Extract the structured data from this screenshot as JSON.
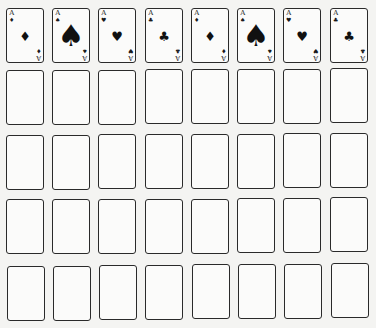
{
  "board": {
    "layout": {
      "columns": 8,
      "rows": 5,
      "origin_x": [
        6,
        52,
        98,
        145,
        191,
        237,
        283,
        330
      ],
      "origin_y": [
        8,
        70,
        134,
        198,
        263
      ]
    },
    "colors": {
      "background": "#f4f4f2",
      "card_border": "#2a2a2a",
      "card_face": "#fbfbfa",
      "ink": "#111111"
    },
    "top_row": [
      {
        "rank": "A",
        "suit": "diamonds",
        "glyph": "♦",
        "pip_size": "small"
      },
      {
        "rank": "A",
        "suit": "spades",
        "glyph": "♠",
        "pip_size": "large"
      },
      {
        "rank": "A",
        "suit": "hearts",
        "glyph": "♥",
        "pip_size": "small"
      },
      {
        "rank": "A",
        "suit": "clubs",
        "glyph": "♣",
        "pip_size": "small"
      },
      {
        "rank": "A",
        "suit": "diamonds",
        "glyph": "♦",
        "pip_size": "small"
      },
      {
        "rank": "A",
        "suit": "spades",
        "glyph": "♠",
        "pip_size": "large"
      },
      {
        "rank": "A",
        "suit": "hearts",
        "glyph": "♥",
        "pip_size": "small"
      },
      {
        "rank": "A",
        "suit": "clubs",
        "glyph": "♣",
        "pip_size": "small"
      }
    ],
    "empty_rows": 4
  }
}
